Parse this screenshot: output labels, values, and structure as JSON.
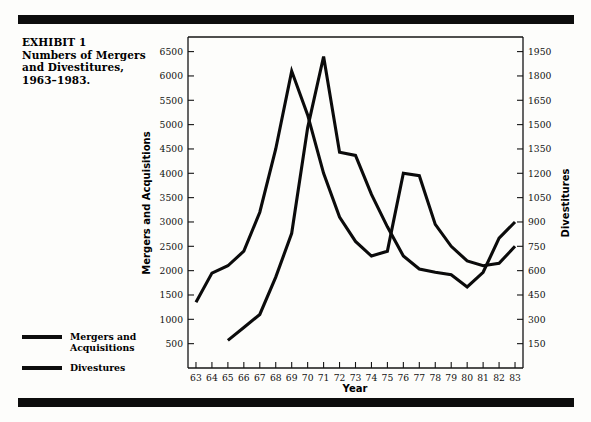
{
  "figure": {
    "caption_lines": [
      "EXHIBIT 1",
      "Numbers of Mergers",
      "and Divestitures,",
      "1963–1983."
    ],
    "rule_color": "#0d0d0d",
    "line_color": "#0b0b0b"
  },
  "legend": {
    "position": "lower-left-outside",
    "entries": [
      {
        "label": "Mergers and Acquisitions",
        "line1": "Mergers and",
        "line2": "Acquisitions"
      },
      {
        "label": "Divestures",
        "line1": "Divestures",
        "line2": ""
      }
    ]
  },
  "chart_data": {
    "type": "line",
    "title": "",
    "xlabel": "Year",
    "ylabel": "Mergers and Acquisitions",
    "y2label": "Divestitures",
    "grid": false,
    "x": [
      63,
      64,
      65,
      66,
      67,
      68,
      69,
      70,
      71,
      72,
      73,
      74,
      75,
      76,
      77,
      78,
      79,
      80,
      81,
      82,
      83
    ],
    "xtick_labels": [
      "63",
      "64",
      "65",
      "66",
      "67",
      "68",
      "69",
      "70",
      "71",
      "72",
      "73",
      "74",
      "75",
      "76",
      "77",
      "78",
      "79",
      "80",
      "81",
      "82",
      "83"
    ],
    "xlim": [
      62.5,
      83.5
    ],
    "ylim": [
      0,
      6800
    ],
    "ytick_labels": [
      "500",
      "1000",
      "1500",
      "2000",
      "2500",
      "3000",
      "3500",
      "4000",
      "4500",
      "5000",
      "5500",
      "6000",
      "6500"
    ],
    "yticks": [
      500,
      1000,
      1500,
      2000,
      2500,
      3000,
      3500,
      4000,
      4500,
      5000,
      5500,
      6000,
      6500
    ],
    "y2lim": [
      0,
      2040
    ],
    "y2tick_labels": [
      "150",
      "300",
      "450",
      "600",
      "750",
      "900",
      "1050",
      "1200",
      "1350",
      "1500",
      "1650",
      "1800",
      "1950"
    ],
    "y2ticks": [
      150,
      300,
      450,
      600,
      750,
      900,
      1050,
      1200,
      1350,
      1500,
      1650,
      1800,
      1950
    ],
    "series": [
      {
        "name": "Mergers and Acquisitions",
        "axis": "left",
        "x": [
          63,
          64,
          65,
          66,
          67,
          68,
          69,
          70,
          71,
          72,
          73,
          74,
          75,
          76,
          77,
          78,
          79,
          80,
          81,
          82,
          83
        ],
        "values": [
          1350,
          1950,
          2100,
          2400,
          3200,
          4500,
          6100,
          5200,
          4000,
          3100,
          2600,
          2300,
          2400,
          4000,
          3950,
          2950,
          2500,
          2200,
          2100,
          2150,
          2500
        ]
      },
      {
        "name": "Divestures",
        "axis": "right",
        "x": [
          65,
          66,
          67,
          68,
          69,
          70,
          71,
          72,
          73,
          74,
          75,
          76,
          77,
          78,
          79,
          80,
          81,
          82,
          83
        ],
        "values": [
          170,
          250,
          330,
          560,
          830,
          1480,
          1920,
          1330,
          1310,
          1070,
          870,
          690,
          610,
          590,
          575,
          500,
          590,
          800,
          900
        ]
      }
    ]
  }
}
